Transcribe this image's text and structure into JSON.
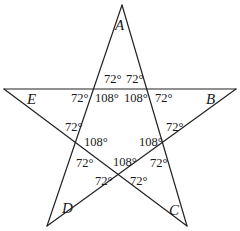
{
  "diagram": {
    "type": "pentagram",
    "stroke_color": "#222222",
    "background": "#ffffff",
    "vertices": [
      {
        "name": "A",
        "x": 122,
        "y": 5
      },
      {
        "name": "B",
        "x": 236,
        "y": 89
      },
      {
        "name": "C",
        "x": 187,
        "y": 226
      },
      {
        "name": "D",
        "x": 47,
        "y": 226
      },
      {
        "name": "E",
        "x": 4,
        "y": 89
      }
    ],
    "vertex_labels": [
      {
        "id": "A",
        "text": "A",
        "x": 117,
        "y": 20
      },
      {
        "id": "B",
        "text": "B",
        "x": 206,
        "y": 92
      },
      {
        "id": "C",
        "text": "C",
        "x": 169,
        "y": 202
      },
      {
        "id": "D",
        "text": "D",
        "x": 60,
        "y": 200
      },
      {
        "id": "E",
        "text": "E",
        "x": 26,
        "y": 92
      }
    ],
    "angle_labels": [
      {
        "id": "top-left-upper",
        "text": "72°",
        "x": 103,
        "y": 74
      },
      {
        "id": "top-right-upper",
        "text": "72°",
        "x": 126,
        "y": 74
      },
      {
        "id": "top-left-outer",
        "text": "72°",
        "x": 72,
        "y": 92
      },
      {
        "id": "top-left-inner",
        "text": "108°",
        "x": 95,
        "y": 92
      },
      {
        "id": "top-right-inner",
        "text": "108°",
        "x": 125,
        "y": 92
      },
      {
        "id": "top-right-outer",
        "text": "72°",
        "x": 155,
        "y": 92
      },
      {
        "id": "left-upper",
        "text": "72°",
        "x": 65,
        "y": 122
      },
      {
        "id": "left-inner",
        "text": "108°",
        "x": 84,
        "y": 138
      },
      {
        "id": "right-inner",
        "text": "108°",
        "x": 139,
        "y": 138
      },
      {
        "id": "right-upper",
        "text": "72°",
        "x": 166,
        "y": 122
      },
      {
        "id": "left-lower",
        "text": "72°",
        "x": 75,
        "y": 157
      },
      {
        "id": "bottom-inner",
        "text": "108°",
        "x": 113,
        "y": 157
      },
      {
        "id": "right-lower",
        "text": "72°",
        "x": 149,
        "y": 157
      },
      {
        "id": "bottom-left",
        "text": "72°",
        "x": 97,
        "y": 175
      },
      {
        "id": "bottom-right",
        "text": "72°",
        "x": 130,
        "y": 175
      }
    ]
  }
}
